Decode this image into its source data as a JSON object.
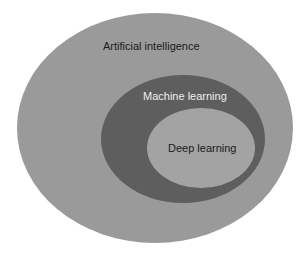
{
  "diagram": {
    "sets": [
      {
        "label": "Artificial intelligence",
        "fill": "#9a9a9a",
        "text_color": "#1a1a1a"
      },
      {
        "label": "Machine learning",
        "fill": "#5e5e5e",
        "text_color": "#eeeeee"
      },
      {
        "label": "Deep learning",
        "fill": "#a3a3a3",
        "text_color": "#1a1a1a"
      }
    ],
    "relation": "Deep learning ⊂ Machine learning ⊂ Artificial intelligence"
  }
}
